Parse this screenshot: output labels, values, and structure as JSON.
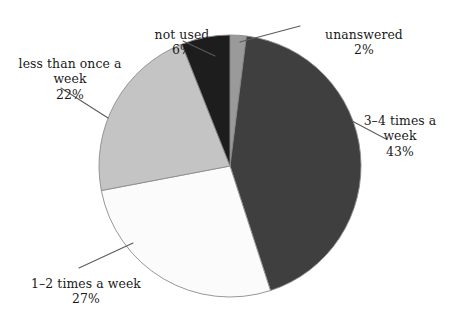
{
  "chart_data": {
    "type": "pie",
    "title": "",
    "subtitle": "",
    "xlabel": "",
    "ylabel": "",
    "legend_position": "none",
    "labels_position": "outside-with-leader-lines",
    "grid": false,
    "units": "percent",
    "total": 100,
    "start_angle_deg": 0,
    "direction": "clockwise",
    "categories": [
      "unanswered",
      "3–4 times a week",
      "1–2 times a week",
      "less than once a week",
      "not used"
    ],
    "values": [
      2,
      43,
      27,
      22,
      6
    ],
    "slices": [
      {
        "id": "unanswered",
        "label": "unanswered",
        "value": 2,
        "value_text": "2%",
        "color": "#9a9a9a",
        "start_deg": 0,
        "end_deg": 7.2
      },
      {
        "id": "three-four-times-a-week",
        "label": "3–4 times a\nweek",
        "value": 43,
        "value_text": "43%",
        "color": "#3f3f3f",
        "start_deg": 7.2,
        "end_deg": 162
      },
      {
        "id": "one-two-times-a-week",
        "label": "1–2 times a week",
        "value": 27,
        "value_text": "27%",
        "color": "#fbfbfb",
        "start_deg": 162,
        "end_deg": 259.2
      },
      {
        "id": "less-than-once-a-week",
        "label": "less than once a\nweek",
        "value": 22,
        "value_text": "22%",
        "color": "#c4c4c4",
        "start_deg": 259.2,
        "end_deg": 338.4
      },
      {
        "id": "not-used",
        "label": "not used",
        "value": 6,
        "value_text": "6%",
        "color": "#1d1d1d",
        "start_deg": 338.4,
        "end_deg": 360
      }
    ],
    "geometry": {
      "center_x": 230,
      "center_y": 166,
      "radius": 131
    },
    "colors": {
      "background": "#ffffff",
      "outline": "#8c8c8c",
      "leader_line": "#5a5a5a",
      "text": "#1a1a1a"
    }
  },
  "labels": {
    "less_than_once_a_week": {
      "text": "less than once a\nweek",
      "pct": "22%"
    },
    "not_used": {
      "text": "not used",
      "pct": "6%"
    },
    "unanswered": {
      "text": "unanswered",
      "pct": "2%"
    },
    "three_four_times_a_week": {
      "text": "3–4 times a\nweek",
      "pct": "43%"
    },
    "one_two_times_a_week": {
      "text": "1–2 times a week",
      "pct": "27%"
    }
  }
}
